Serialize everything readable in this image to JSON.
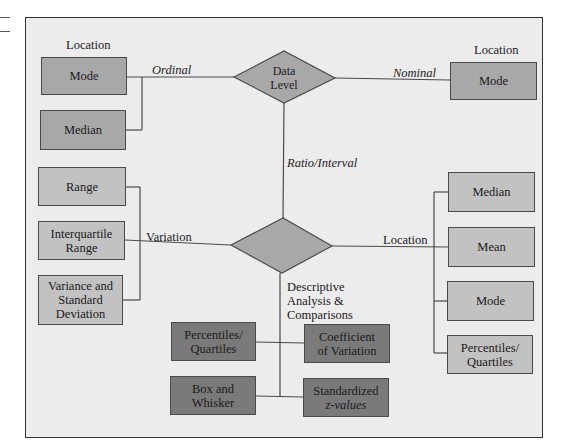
{
  "diagram": {
    "root": {
      "label_line1": "Data",
      "label_line2": "Level"
    },
    "branches": {
      "ordinal": {
        "edge_label": "Ordinal",
        "group_label": "Location",
        "items": [
          "Mode",
          "Median"
        ]
      },
      "nominal": {
        "edge_label": "Nominal",
        "group_label": "Location",
        "items": [
          "Mode"
        ]
      },
      "ratio_interval": {
        "edge_label": "Ratio/Interval",
        "node_label": [
          "Descriptive",
          "Analysis &",
          "Comparisons"
        ],
        "variation": {
          "edge_label": "Variation",
          "items": [
            {
              "lines": [
                "Range"
              ]
            },
            {
              "lines": [
                "Interquartile",
                "Range"
              ]
            },
            {
              "lines": [
                "Variance and",
                "Standard",
                "Deviation"
              ]
            }
          ]
        },
        "location": {
          "edge_label": "Location",
          "items": [
            {
              "lines": [
                "Median"
              ]
            },
            {
              "lines": [
                "Mean"
              ]
            },
            {
              "lines": [
                "Mode"
              ]
            },
            {
              "lines": [
                "Percentiles/",
                "Quartiles"
              ]
            }
          ]
        },
        "comparisons": {
          "items": [
            {
              "lines": [
                "Percentiles/",
                "Quartiles"
              ]
            },
            {
              "lines": [
                "Coefficient",
                "of Variation"
              ]
            },
            {
              "lines": [
                "Box and",
                "Whisker"
              ]
            },
            {
              "lines": [
                "Standardized",
                "z-values"
              ]
            }
          ]
        }
      }
    },
    "colors": {
      "background": "#ececec",
      "diamond": "#a8a8a8",
      "level1_box": "#a8a8a8",
      "level2_box": "#c2c2c2",
      "level3_box": "#7a7a7a",
      "line": "#4a4a4a"
    }
  }
}
